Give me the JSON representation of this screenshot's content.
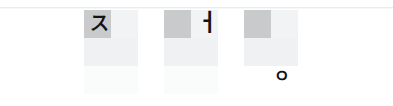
{
  "canvas": {
    "width": 393,
    "height": 106,
    "background": "#ffffff"
  },
  "rule": {
    "name": "top-separator",
    "color": "#eceded"
  },
  "palette": {
    "cell_highlight": "#c9cacb",
    "cell_faint": "#f2f3f4",
    "cell_soft": "#f0f1f2",
    "cell_very_light": "#fafbfb",
    "glyph": "#131313",
    "page_background": "#ffffff"
  },
  "groups": [
    {
      "id": "group-1",
      "glyph": "ス",
      "glyph_name": "katakana-su",
      "glyph_position": "row1-col1",
      "cells": [
        {
          "row": 1,
          "col": 1,
          "shade": "strong"
        },
        {
          "row": 1,
          "col": 2,
          "shade": "faint"
        },
        {
          "row": 2,
          "col": 1,
          "shade": "soft"
        },
        {
          "row": 2,
          "col": 2,
          "shade": "soft"
        },
        {
          "row": 3,
          "col": 1,
          "shade": "vlight"
        },
        {
          "row": 3,
          "col": 2,
          "shade": "vlight"
        }
      ]
    },
    {
      "id": "group-2",
      "glyph": "ㅓ",
      "glyph_name": "hangul-jamo-eo",
      "glyph_position": "row1-col2",
      "cells": [
        {
          "row": 1,
          "col": 1,
          "shade": "strong"
        },
        {
          "row": 1,
          "col": 2,
          "shade": "faint"
        },
        {
          "row": 2,
          "col": 1,
          "shade": "soft"
        },
        {
          "row": 2,
          "col": 2,
          "shade": "soft"
        },
        {
          "row": 3,
          "col": 1,
          "shade": "vlight"
        },
        {
          "row": 3,
          "col": 2,
          "shade": "vlight"
        }
      ]
    },
    {
      "id": "group-3",
      "glyph": "ㅇ",
      "glyph_name": "hangul-jamo-ieung",
      "glyph_position": "row3-col2",
      "cells": [
        {
          "row": 1,
          "col": 1,
          "shade": "strong"
        },
        {
          "row": 1,
          "col": 2,
          "shade": "faint"
        },
        {
          "row": 2,
          "col": 1,
          "shade": "soft"
        },
        {
          "row": 2,
          "col": 2,
          "shade": "soft"
        },
        {
          "row": 3,
          "col": 1,
          "shade": "none"
        },
        {
          "row": 3,
          "col": 2,
          "shade": "none"
        }
      ]
    }
  ]
}
